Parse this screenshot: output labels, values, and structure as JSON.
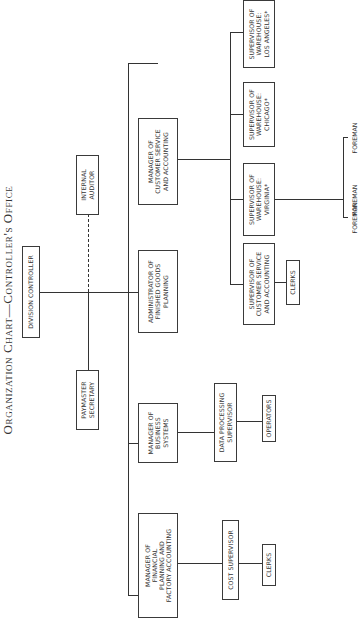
{
  "title": "Organization Chart—Controller's Office",
  "nodes": {
    "division_controller": "Division Controller",
    "internal_auditor": "Internal\nAuditor",
    "paymaster_secretary": "Paymaster\nSecretary",
    "mgr_customer_service": "Manager of\nCustomer Service\nand Accounting",
    "admin_finished_goods": "Administrator of\nFinished Goods\nPlanning",
    "mgr_business_systems": "Manager of\nBusiness\nSystems",
    "mgr_financial_planning": "Manager of\nFinancial\nPlanning and\nFactory Accounting",
    "cost_supervisor": "Cost Supervisor",
    "clerks_cost": "Clerks",
    "data_processing_supervisor": "Data Processing\nSupervisor",
    "operators": "Operators",
    "sup_customer_service": "Supervisor of\nCustomer Service\nand Accounting",
    "clerks_customer_service": "Clerks",
    "sup_wh_virginia": "Supervisor of\nWarehouse:\nVirginia*",
    "sup_wh_chicago": "Supervisor of\nWarehouse:\nChicago*",
    "sup_wh_los_angeles": "Supervisor of\nWarehouse:\nLos Angeles*",
    "foreman_1": "Foreman",
    "foreman_2": "Foreman",
    "foreman_3": "Foreman"
  },
  "relationships": [
    {
      "parent": "Division Controller",
      "child": "Internal Auditor",
      "style": "dashed"
    },
    {
      "parent": "Division Controller",
      "child": "Paymaster Secretary",
      "style": "solid"
    },
    {
      "parent": "Division Controller",
      "child": "Manager of Financial Planning and Factory Accounting",
      "style": "solid"
    },
    {
      "parent": "Division Controller",
      "child": "Manager of Business Systems",
      "style": "solid"
    },
    {
      "parent": "Division Controller",
      "child": "Administrator of Finished Goods Planning",
      "style": "solid"
    },
    {
      "parent": "Division Controller",
      "child": "Manager of Customer Service and Accounting",
      "style": "solid"
    },
    {
      "parent": "Manager of Financial Planning and Factory Accounting",
      "child": "Cost Supervisor",
      "style": "solid"
    },
    {
      "parent": "Cost Supervisor",
      "child": "Clerks",
      "style": "solid"
    },
    {
      "parent": "Manager of Business Systems",
      "child": "Data Processing Supervisor",
      "style": "solid"
    },
    {
      "parent": "Data Processing Supervisor",
      "child": "Operators",
      "style": "solid"
    },
    {
      "parent": "Manager of Customer Service and Accounting",
      "child": "Supervisor of Customer Service and Accounting",
      "style": "solid"
    },
    {
      "parent": "Supervisor of Customer Service and Accounting",
      "child": "Clerks",
      "style": "solid"
    },
    {
      "parent": "Manager of Customer Service and Accounting",
      "child": "Supervisor of Warehouse: Virginia*",
      "style": "solid"
    },
    {
      "parent": "Manager of Customer Service and Accounting",
      "child": "Supervisor of Warehouse: Chicago*",
      "style": "solid"
    },
    {
      "parent": "Manager of Customer Service and Accounting",
      "child": "Supervisor of Warehouse: Los Angeles*",
      "style": "solid"
    },
    {
      "parent": "Supervisor of Warehouse: Virginia*",
      "child": "Foreman (x3)",
      "style": "solid"
    }
  ]
}
